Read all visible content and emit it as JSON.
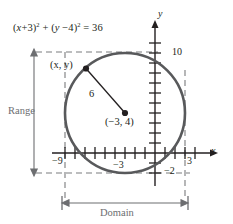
{
  "figure": {
    "colors": {
      "curve": "#58595b",
      "axis": "#231f20",
      "dashed": "#6d6e71",
      "text": "#231f20",
      "gray_text": "#6d6e71"
    }
  },
  "equation": {
    "prefix": "(",
    "full": "(x+3)² + (y−4)² = 36",
    "x_term": "x",
    "x_offset": "+3",
    "y_term": "y",
    "y_offset": "−4",
    "rhs": "36"
  },
  "annotations": {
    "point_label": "(x, y)",
    "radius_label": "6",
    "center_label": "(−3, 4)",
    "range_label": "Range",
    "domain_label": "Domain"
  },
  "axes": {
    "x_title": "x",
    "y_title": "y",
    "x_ticks_labeled": [
      {
        "value": -9,
        "label": "−9"
      },
      {
        "value": -3,
        "label": "−3"
      },
      {
        "value": 3,
        "label": "3"
      }
    ],
    "y_ticks_labeled": [
      {
        "value": 10,
        "label": "10"
      },
      {
        "value": -2,
        "label": "−2"
      }
    ]
  },
  "chart_data": {
    "type": "scatter",
    "xlabel": "x",
    "ylabel": "y",
    "grid": false,
    "legend": "none",
    "xlim": [
      -11.5,
      5.5
    ],
    "ylim": [
      -4,
      13
    ],
    "shapes": [
      {
        "kind": "circle",
        "center": [
          -3,
          4
        ],
        "radius": 6,
        "equation": "(x+3)² + (y−4)² = 36"
      }
    ],
    "points": [
      {
        "label": "(x, y)",
        "x": -6.9,
        "y": 8.55
      },
      {
        "label": "(−3, 4)",
        "x": -3,
        "y": 4
      }
    ],
    "segments": [
      {
        "from": [
          -6.9,
          8.55
        ],
        "to": [
          -3,
          4
        ],
        "label": "6",
        "meaning": "radius"
      }
    ],
    "domain": {
      "from": -9,
      "to": 3,
      "label": "Domain"
    },
    "range": {
      "from": -2,
      "to": 10,
      "label": "Range"
    },
    "x_tick_labels": [
      "−9",
      "−3",
      "3"
    ],
    "y_tick_labels": [
      "10",
      "−2"
    ]
  }
}
